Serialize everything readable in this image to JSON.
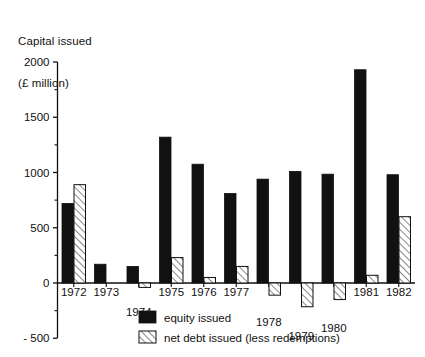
{
  "chart_data": {
    "type": "bar",
    "title": "Capital issued\n(£ million)",
    "title_line1": "Capital issued",
    "title_line2": "(£ million)",
    "xlabel": "",
    "ylabel": "Capital issued (£ million)",
    "ylim": [
      -500,
      2000
    ],
    "ytick_step": 500,
    "yminor_step": 250,
    "grid": false,
    "legend_position": "bottom-left",
    "categories": [
      "1972",
      "1973",
      "1974",
      "1975",
      "1976",
      "1977",
      "1978",
      "1979",
      "1980",
      "1981",
      "1982"
    ],
    "yticks": [
      -500,
      0,
      500,
      1000,
      1500,
      2000
    ],
    "ytick_labels": [
      "- 500",
      "0",
      "500",
      "1000",
      "1500",
      "2000"
    ],
    "series": [
      {
        "name": "equity issued",
        "style": "solid-black",
        "values": [
          720,
          170,
          150,
          1320,
          1075,
          810,
          940,
          1010,
          985,
          1930,
          980
        ]
      },
      {
        "name": "net debt issued (less redemptions)",
        "style": "hatched",
        "values": [
          890,
          0,
          -40,
          230,
          50,
          150,
          -110,
          -215,
          -150,
          70,
          600
        ]
      }
    ]
  },
  "legend": {
    "items": [
      {
        "label": "equity issued",
        "swatch": "solid-black"
      },
      {
        "label": "net debt issued (less redemptions)",
        "swatch": "hatched"
      }
    ]
  },
  "colors": {
    "ink": "#111111",
    "background": "#ffffff"
  }
}
